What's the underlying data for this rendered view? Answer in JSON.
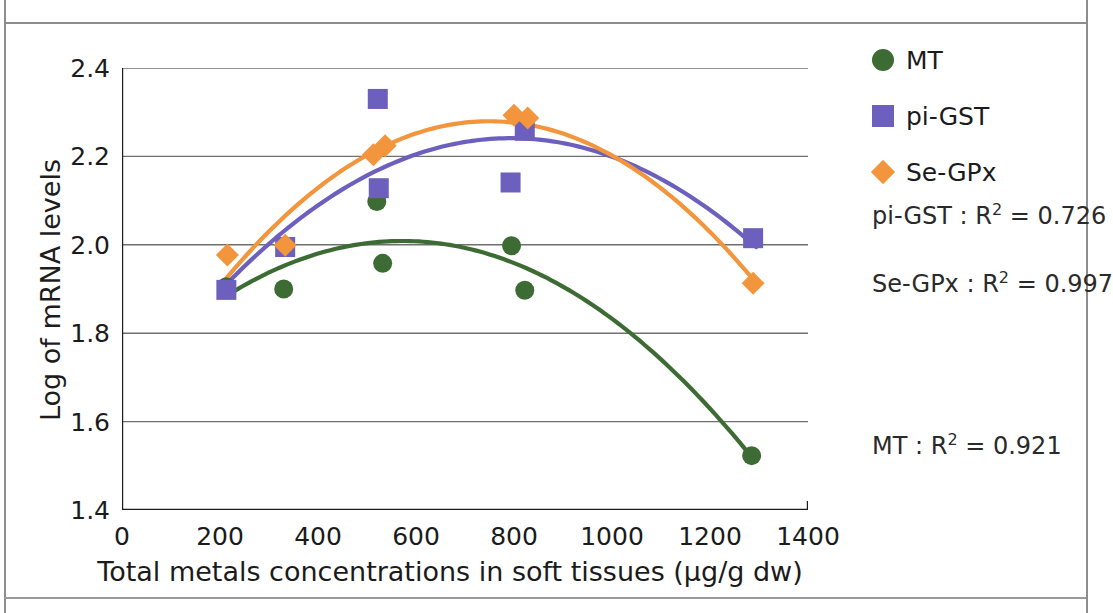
{
  "chart_data": {
    "type": "scatter",
    "title": "",
    "xlabel": "Total metals concentrations in soft tissues (µg/g dw)",
    "ylabel": "Log of mRNA levels",
    "xlim": [
      0,
      1400
    ],
    "ylim": [
      1.4,
      2.4
    ],
    "xticks": [
      0,
      200,
      400,
      600,
      800,
      1000,
      1200,
      1400
    ],
    "yticks": [
      "1.4",
      "1.6",
      "1.8",
      "2.0",
      "2.2",
      "2.4"
    ],
    "xtick_labels": [
      "0",
      "200",
      "400",
      "600",
      "800",
      "1000",
      "1200",
      "1400"
    ],
    "grid": "horizontal",
    "legend_position": "right-top",
    "series": [
      {
        "name": "MT",
        "marker": "circle",
        "color": "#3d6b34",
        "points": [
          {
            "x": 213,
            "y": 1.905
          },
          {
            "x": 330,
            "y": 1.9
          },
          {
            "x": 520,
            "y": 2.098
          },
          {
            "x": 532,
            "y": 1.958
          },
          {
            "x": 795,
            "y": 1.998
          },
          {
            "x": 822,
            "y": 1.897
          },
          {
            "x": 1285,
            "y": 1.523
          }
        ],
        "trend": {
          "type": "quadratic",
          "r2": "0.921",
          "label": "MT : R² = 0.921"
        }
      },
      {
        "name": "pi-GST",
        "marker": "square",
        "color": "#6c5fbe",
        "points": [
          {
            "x": 213,
            "y": 1.898
          },
          {
            "x": 333,
            "y": 1.995
          },
          {
            "x": 522,
            "y": 2.33
          },
          {
            "x": 524,
            "y": 2.128
          },
          {
            "x": 793,
            "y": 2.141
          },
          {
            "x": 822,
            "y": 2.258
          },
          {
            "x": 1288,
            "y": 2.015
          }
        ],
        "trend": {
          "type": "quadratic",
          "r2": "0.726",
          "label": "pi-GST : R² = 0.726"
        }
      },
      {
        "name": "Se-GPx",
        "marker": "diamond",
        "color": "#f3953d",
        "points": [
          {
            "x": 215,
            "y": 1.977
          },
          {
            "x": 333,
            "y": 1.999
          },
          {
            "x": 513,
            "y": 2.204
          },
          {
            "x": 537,
            "y": 2.224
          },
          {
            "x": 800,
            "y": 2.293
          },
          {
            "x": 828,
            "y": 2.287
          },
          {
            "x": 1288,
            "y": 1.913
          }
        ],
        "trend": {
          "type": "quadratic",
          "r2": "0.997",
          "label": "Se-GPx : R² = 0.997"
        }
      }
    ],
    "annotations": [
      {
        "id": "r2-pigst",
        "text_main": "pi-GST : R",
        "sup": "2",
        "text_tail": " = 0.726"
      },
      {
        "id": "r2-segpx",
        "text_main": "Se-GPx : R",
        "sup": "2",
        "text_tail": " = 0.997"
      },
      {
        "id": "r2-mt",
        "text_main": "MT : R",
        "sup": "2",
        "text_tail": " = 0.921"
      }
    ]
  },
  "legend": {
    "items": [
      {
        "label": "MT",
        "color": "#3d6b34",
        "marker": "circle"
      },
      {
        "label": "pi-GST",
        "color": "#6c5fbe",
        "marker": "square"
      },
      {
        "label": "Se-GPx",
        "color": "#f3953d",
        "marker": "diamond"
      }
    ]
  },
  "axes": {
    "y_title": "Log of mRNA levels",
    "x_title": "Total metals concentrations in soft tissues (µg/g dw)",
    "y_tick_labels": [
      "2.4",
      "2.2",
      "2.0",
      "1.8",
      "1.6",
      "1.4"
    ],
    "x_tick_labels": [
      "0",
      "200",
      "400",
      "600",
      "800",
      "1000",
      "1200",
      "1400"
    ]
  },
  "colors": {
    "mt": "#3d6b34",
    "pigst": "#6c5fbe",
    "segpx": "#f3953d",
    "axis": "#1b1b1b",
    "grid": "#6f6f6f"
  }
}
